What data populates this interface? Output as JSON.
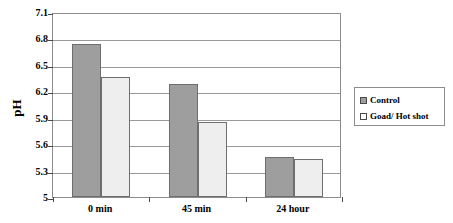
{
  "chart_data": {
    "type": "bar",
    "title": "",
    "xlabel": "",
    "ylabel": "pH",
    "categories": [
      "0 min",
      "45 min",
      "24 hour"
    ],
    "series": [
      {
        "name": "Control",
        "values": [
          6.74,
          6.28,
          5.45
        ],
        "color": "#9e9e9e"
      },
      {
        "name": "Goad/ Hot shot",
        "values": [
          6.36,
          5.85,
          5.43
        ],
        "color": "#eeeeee"
      }
    ],
    "ylim": [
      5,
      7.1
    ],
    "yticks": [
      5,
      5.3,
      5.6,
      5.9,
      6.2,
      6.5,
      6.8,
      7.1
    ],
    "ytick_labels": [
      "5",
      "5.3",
      "5.6",
      "5.9",
      "6.2",
      "6.5",
      "6.8",
      "7.1"
    ],
    "grid": true,
    "legend_position": "right"
  },
  "legend": {
    "entries": [
      {
        "label": "Control",
        "swatch": "control"
      },
      {
        "label": "Goad/ Hot shot",
        "swatch": "treat"
      }
    ]
  }
}
